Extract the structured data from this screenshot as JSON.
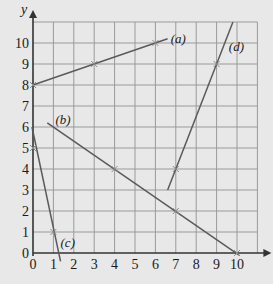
{
  "chart_data": {
    "type": "line",
    "title": "",
    "xlabel": "x",
    "ylabel": "y",
    "xlim": [
      0,
      11
    ],
    "ylim": [
      0,
      11
    ],
    "grid": true,
    "x_ticks": [
      "0",
      "1",
      "2",
      "3",
      "4",
      "5",
      "6",
      "7",
      "8",
      "9",
      "10"
    ],
    "y_ticks": [
      "0",
      "1",
      "2",
      "3",
      "4",
      "5",
      "6",
      "7",
      "8",
      "9",
      "10"
    ],
    "series": [
      {
        "name": "(a)",
        "equation": "y = x/3 + 8",
        "x": [
          0,
          6.6
        ],
        "y": [
          8,
          10.2
        ],
        "marked_points": [
          [
            0,
            8
          ],
          [
            3,
            9
          ],
          [
            6,
            10
          ]
        ]
      },
      {
        "name": "(b)",
        "equation": "y = -2x/3 + 20/3",
        "x": [
          0.7,
          10.1
        ],
        "y": [
          6.2,
          -0.1
        ],
        "marked_points": [
          [
            4,
            4
          ],
          [
            7,
            2
          ],
          [
            10,
            0
          ]
        ]
      },
      {
        "name": "(c)",
        "equation": "y = 5 - 4x",
        "x": [
          -0.05,
          1.35
        ],
        "y": [
          6.0,
          -0.4
        ],
        "marked_points": [
          [
            0,
            5
          ],
          [
            1,
            1
          ]
        ]
      },
      {
        "name": "(d)",
        "equation": "y = 2.5x - 13.5",
        "x": [
          6.6,
          9.8
        ],
        "y": [
          3.0,
          11.0
        ],
        "marked_points": [
          [
            7,
            4
          ],
          [
            9,
            9
          ]
        ]
      }
    ],
    "annotations": [
      {
        "text": "(a)",
        "x": 6.75,
        "y": 10.2
      },
      {
        "text": "(b)",
        "x": 1.1,
        "y": 6.35
      },
      {
        "text": "(c)",
        "x": 1.35,
        "y": 0.5
      },
      {
        "text": "(d)",
        "x": 9.6,
        "y": 9.8
      }
    ]
  },
  "colors": {
    "background": "#e8e8e8",
    "grid": "#9a9a9a",
    "axis": "#333333",
    "line": "#5a5a5a",
    "marker": "#8a8a8a"
  }
}
